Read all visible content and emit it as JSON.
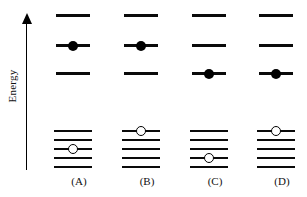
{
  "figure": {
    "background_color": "#ffffff",
    "line_color": "#0a0a0a",
    "electron_fill": "#000000",
    "hole_fill": "#ffffff"
  },
  "axis": {
    "label": "Energy",
    "direction": "up",
    "arrow_icon": "up-arrow-icon"
  },
  "legend": {
    "electron_symbol": "filled-circle",
    "electron_meaning": "electron",
    "hole_symbol": "open-circle",
    "hole_meaning": "hole"
  },
  "diagrams": [
    {
      "id": "A",
      "caption": "(A)",
      "upper_level_count": 4,
      "upper_levels": [
        {
          "index": 1,
          "y": 14,
          "occupied": false,
          "marker": "none"
        },
        {
          "index": 2,
          "y": 44,
          "occupied": true,
          "marker": "filled-circle"
        },
        {
          "index": 3,
          "y": 72,
          "occupied": false,
          "marker": "none"
        }
      ],
      "lower_level_count": 5,
      "lower_levels": [
        {
          "index": 1,
          "y": 0,
          "occupied": false,
          "marker": "none"
        },
        {
          "index": 2,
          "y": 9,
          "occupied": false,
          "marker": "none"
        },
        {
          "index": 3,
          "y": 18,
          "occupied": true,
          "marker": "open-circle"
        },
        {
          "index": 4,
          "y": 27,
          "occupied": false,
          "marker": "none"
        },
        {
          "index": 5,
          "y": 36,
          "occupied": false,
          "marker": "none"
        }
      ]
    },
    {
      "id": "B",
      "caption": "(B)",
      "upper_level_count": 3,
      "upper_levels": [
        {
          "index": 1,
          "y": 14,
          "occupied": false,
          "marker": "none"
        },
        {
          "index": 2,
          "y": 44,
          "occupied": true,
          "marker": "filled-circle"
        },
        {
          "index": 3,
          "y": 72,
          "occupied": false,
          "marker": "none"
        }
      ],
      "lower_level_count": 5,
      "lower_levels": [
        {
          "index": 1,
          "y": 0,
          "occupied": true,
          "marker": "open-circle"
        },
        {
          "index": 2,
          "y": 9,
          "occupied": false,
          "marker": "none"
        },
        {
          "index": 3,
          "y": 18,
          "occupied": false,
          "marker": "none"
        },
        {
          "index": 4,
          "y": 27,
          "occupied": false,
          "marker": "none"
        },
        {
          "index": 5,
          "y": 36,
          "occupied": false,
          "marker": "none"
        }
      ]
    },
    {
      "id": "C",
      "caption": "(C)",
      "upper_level_count": 3,
      "upper_levels": [
        {
          "index": 1,
          "y": 14,
          "occupied": false,
          "marker": "none"
        },
        {
          "index": 2,
          "y": 44,
          "occupied": false,
          "marker": "none"
        },
        {
          "index": 3,
          "y": 72,
          "occupied": true,
          "marker": "filled-circle"
        }
      ],
      "lower_level_count": 5,
      "lower_levels": [
        {
          "index": 1,
          "y": 0,
          "occupied": false,
          "marker": "none"
        },
        {
          "index": 2,
          "y": 9,
          "occupied": false,
          "marker": "none"
        },
        {
          "index": 3,
          "y": 18,
          "occupied": false,
          "marker": "none"
        },
        {
          "index": 4,
          "y": 27,
          "occupied": true,
          "marker": "open-circle"
        },
        {
          "index": 5,
          "y": 36,
          "occupied": false,
          "marker": "none"
        }
      ]
    },
    {
      "id": "D",
      "caption": "(D)",
      "upper_level_count": 3,
      "upper_levels": [
        {
          "index": 1,
          "y": 14,
          "occupied": false,
          "marker": "none"
        },
        {
          "index": 2,
          "y": 44,
          "occupied": false,
          "marker": "none"
        },
        {
          "index": 3,
          "y": 72,
          "occupied": true,
          "marker": "filled-circle"
        }
      ],
      "lower_level_count": 5,
      "lower_levels": [
        {
          "index": 1,
          "y": 0,
          "occupied": true,
          "marker": "open-circle"
        },
        {
          "index": 2,
          "y": 9,
          "occupied": false,
          "marker": "none"
        },
        {
          "index": 3,
          "y": 18,
          "occupied": false,
          "marker": "none"
        },
        {
          "index": 4,
          "y": 27,
          "occupied": false,
          "marker": "none"
        },
        {
          "index": 5,
          "y": 36,
          "occupied": false,
          "marker": "none"
        }
      ]
    }
  ]
}
